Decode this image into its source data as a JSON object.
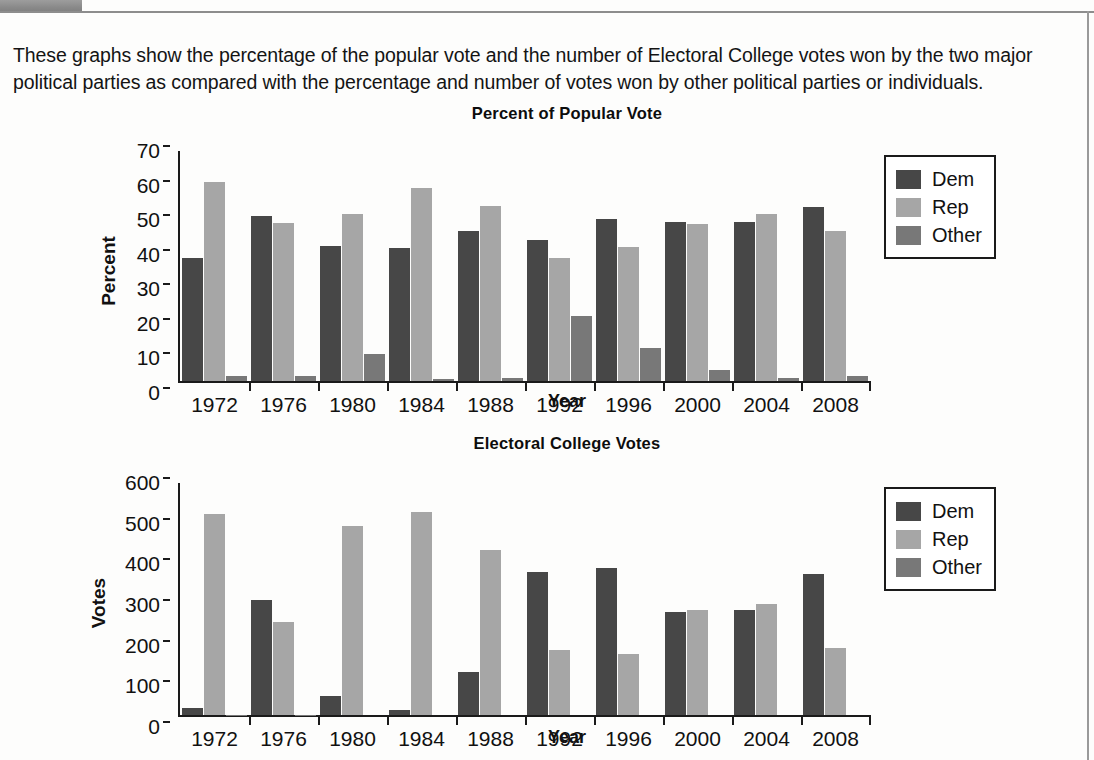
{
  "page": {
    "intro_text": "These graphs show the percentage of the popular vote and the number of Electoral College votes won by the two major political parties as compared with the percentage and number of votes won by other political parties or individuals.",
    "colors": {
      "dem": "#474747",
      "rep": "#a6a6a6",
      "other": "#787878",
      "axis": "#1a1a1a",
      "tab": "#8a8a8a"
    }
  },
  "chart_data": [
    {
      "id": "popular",
      "type": "bar",
      "title": "Percent of Popular Vote",
      "xlabel": "Year",
      "ylabel": "Percent",
      "categories": [
        "1972",
        "1976",
        "1980",
        "1984",
        "1988",
        "1992",
        "1996",
        "2000",
        "2004",
        "2008"
      ],
      "yticks": [
        "70",
        "60",
        "50",
        "40",
        "30",
        "20",
        "10",
        "0"
      ],
      "ylim": [
        0,
        70
      ],
      "grid": false,
      "legend_position": "right",
      "series": [
        {
          "name": "Dem",
          "values": [
            37.5,
            50.1,
            41.0,
            40.6,
            45.6,
            43.0,
            49.2,
            48.4,
            48.3,
            52.9
          ]
        },
        {
          "name": "Rep",
          "values": [
            60.7,
            48.0,
            50.7,
            58.8,
            53.4,
            37.4,
            40.7,
            47.9,
            50.7,
            45.7
          ]
        },
        {
          "name": "Other",
          "values": [
            1.4,
            1.6,
            8.2,
            0.7,
            0.9,
            19.7,
            9.9,
            3.3,
            0.8,
            1.4
          ]
        }
      ]
    },
    {
      "id": "electoral",
      "type": "bar",
      "title": "Electoral College Votes",
      "xlabel": "Year",
      "ylabel": "Votes",
      "categories": [
        "1972",
        "1976",
        "1980",
        "1984",
        "1988",
        "1992",
        "1996",
        "2000",
        "2004",
        "2008"
      ],
      "yticks": [
        "600",
        "500",
        "400",
        "300",
        "200",
        "100",
        "0"
      ],
      "ylim": [
        0,
        600
      ],
      "grid": false,
      "legend_position": "right",
      "series": [
        {
          "name": "Dem",
          "values": [
            17,
            297,
            49,
            13,
            111,
            370,
            379,
            266,
            271,
            365
          ]
        },
        {
          "name": "Rep",
          "values": [
            520,
            240,
            489,
            525,
            426,
            168,
            159,
            271,
            286,
            173
          ]
        },
        {
          "name": "Other",
          "values": [
            1,
            1,
            0,
            0,
            0,
            0,
            0,
            0,
            0,
            0
          ]
        }
      ]
    }
  ],
  "legend": {
    "items": [
      {
        "label": "Dem",
        "swatch": "dem"
      },
      {
        "label": "Rep",
        "swatch": "rep"
      },
      {
        "label": "Other",
        "swatch": "other"
      }
    ]
  }
}
